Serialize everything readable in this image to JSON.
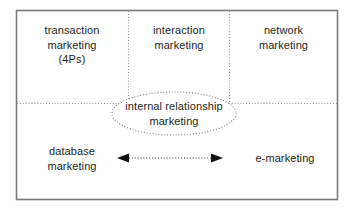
{
  "diagram": {
    "frame": {
      "border_color": "#7a7a7a",
      "background": "#ffffff"
    },
    "divider_color": "#8c8c8c",
    "text_color": "#231f20",
    "quadrants": [
      {
        "name": "transaction-marketing",
        "label": "transaction\nmarketing\n(4Ps)"
      },
      {
        "name": "interaction-marketing",
        "label": "interaction\nmarketing"
      },
      {
        "name": "network-marketing",
        "label": "network\nmarketing"
      },
      {
        "name": "database-marketing",
        "label": "database\nmarketing"
      },
      {
        "name": "e-marketing",
        "label": "e-marketing"
      }
    ],
    "center": {
      "name": "internal-relationship-marketing",
      "label": "internal relationship\nmarketing",
      "shape": "ellipse",
      "border_style": "dotted"
    },
    "connector": {
      "name": "bidirectional-arrow",
      "style": "dotted",
      "heads": "both"
    }
  }
}
